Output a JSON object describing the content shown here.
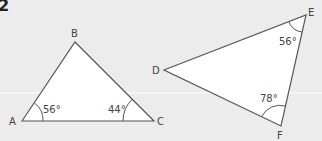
{
  "question_number": "2",
  "triangles": [
    {
      "name": "ABC",
      "vertices": {
        "A": "A",
        "B": "B",
        "C": "C"
      },
      "angles": {
        "A": "56°",
        "C": "44°"
      }
    },
    {
      "name": "DEF",
      "vertices": {
        "D": "D",
        "E": "E",
        "F": "F"
      },
      "angles": {
        "E": "56°",
        "F": "78°"
      }
    }
  ],
  "colors": {
    "background": "#ececec",
    "fill": "#ffffff",
    "stroke": "#555555",
    "label": "#444444"
  }
}
